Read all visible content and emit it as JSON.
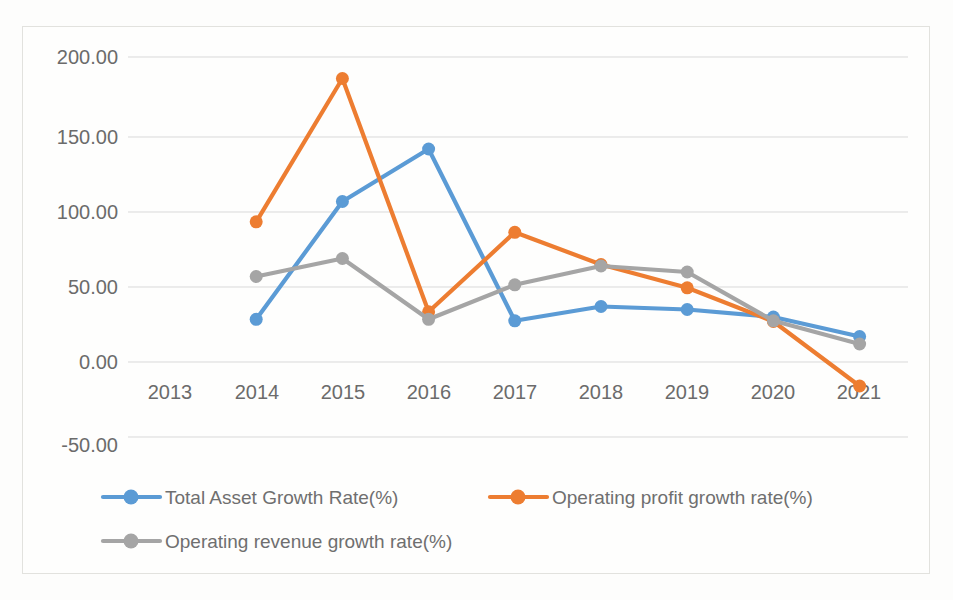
{
  "chart_data": {
    "type": "line",
    "title": "",
    "xlabel": "",
    "ylabel": "",
    "categories": [
      "2013",
      "2014",
      "2015",
      "2016",
      "2017",
      "2018",
      "2019",
      "2020",
      "2021"
    ],
    "ylim": [
      -50,
      200
    ],
    "ytick_labels": [
      "200.00",
      "150.00",
      "100.00",
      "50.00",
      "0.00",
      "-50.00"
    ],
    "ytick_values": [
      200,
      150,
      100,
      50,
      0,
      -50
    ],
    "grid": true,
    "legend_position": "bottom",
    "series": [
      {
        "name": "Total Asset Growth Rate(%)",
        "color": "#5B9BD5",
        "values": [
          null,
          28.5,
          107.0,
          142.0,
          27.5,
          37.0,
          35.0,
          30.0,
          17.0
        ]
      },
      {
        "name": "Operating profit growth rate(%)",
        "color": "#ED7D31",
        "values": [
          null,
          93.5,
          189.0,
          33.5,
          86.5,
          65.0,
          49.5,
          27.0,
          -16.0
        ]
      },
      {
        "name": "Operating revenue growth rate(%)",
        "color": "#A5A5A5",
        "values": [
          null,
          57.0,
          69.0,
          28.5,
          51.5,
          64.0,
          60.0,
          27.5,
          12.0
        ]
      }
    ]
  },
  "axis": {
    "ytick_0": "200.00",
    "ytick_1": "150.00",
    "ytick_2": "100.00",
    "ytick_3": "50.00",
    "ytick_4": "0.00",
    "ytick_5": "-50.00",
    "xtick_0": "2013",
    "xtick_1": "2014",
    "xtick_2": "2015",
    "xtick_3": "2016",
    "xtick_4": "2017",
    "xtick_5": "2018",
    "xtick_6": "2019",
    "xtick_7": "2020",
    "xtick_8": "2021"
  },
  "legend": {
    "item_0": "Total Asset Growth Rate(%)",
    "item_1": "Operating profit growth rate(%)",
    "item_2": "Operating revenue growth rate(%)"
  },
  "colors": {
    "series_blue": "#5B9BD5",
    "series_orange": "#ED7D31",
    "series_gray": "#A5A5A5",
    "gridline": "#d9d9d9",
    "text": "#6b6b6b"
  }
}
